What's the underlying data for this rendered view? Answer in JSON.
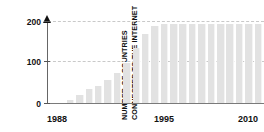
{
  "chart_data": {
    "type": "bar",
    "title": "",
    "subtitle": "",
    "xlabel": "",
    "ylabel": "NUMBER OF COUNTRIES CONNECTED TO THE INTERNET",
    "ylabel_lines": [
      "NUMBER OF COUNTRIES",
      "CONNECTED TO THE INTERNET"
    ],
    "ylim": [
      0,
      210
    ],
    "yticks": [
      0,
      100,
      200
    ],
    "ytick_labels": [
      "0",
      "100",
      "200"
    ],
    "xlim": [
      1988,
      2011
    ],
    "xticks": [
      1988,
      1995,
      2010
    ],
    "xtick_labels": [
      "1988",
      "1995",
      "2010"
    ],
    "grid": "horizontal-dashed",
    "legend": "none",
    "bar_color": "#e2e2e2",
    "axis_color": "#666666",
    "grid_color": "#c9c9c9",
    "text_color": "#111111",
    "categories": [
      1988,
      1989,
      1990,
      1991,
      1992,
      1993,
      1994,
      1995,
      1996,
      1997,
      1998,
      1999,
      2000,
      2001,
      2002,
      2003,
      2004,
      2005,
      2006,
      2007,
      2008,
      2009,
      2010
    ],
    "values": [
      0,
      0,
      8,
      20,
      35,
      41,
      56,
      75,
      98,
      135,
      170,
      190,
      194,
      196,
      196,
      196,
      196,
      196,
      196,
      196,
      196,
      196,
      196
    ]
  },
  "ytick_positions": {
    "t200": "200",
    "t100": "100",
    "t0": "0"
  },
  "xtick_entries": [
    {
      "label": "1988",
      "left": 47
    },
    {
      "label": "1995",
      "left": 154
    },
    {
      "label": "2010",
      "left": 238
    }
  ]
}
